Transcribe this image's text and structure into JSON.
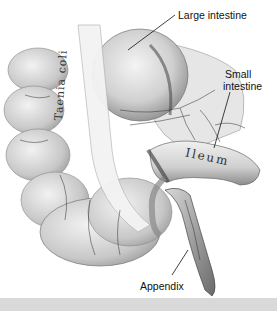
{
  "figure": {
    "labels": {
      "large_intestine": "Large intestine",
      "small_intestine_line1": "Small",
      "small_intestine_line2": "intestine",
      "appendix": "Appendix"
    },
    "inline_text": {
      "taenia_coli": "Taenia coli",
      "ileum": "Ileum"
    }
  },
  "colors": {
    "background": "#ffffff",
    "tissue_light": "#e8e8e8",
    "tissue_mid": "#b5b5b5",
    "tissue_dark": "#555555",
    "bottom_bar": "#d9d9d9"
  }
}
